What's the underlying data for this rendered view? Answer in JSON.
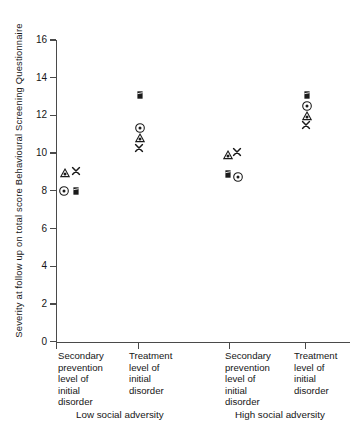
{
  "chart_data": {
    "type": "scatter",
    "title": "",
    "xlabel": "",
    "ylabel": "Severity at follow up on total score Behavioural Screening Questionnaire",
    "ylim": [
      0,
      16
    ],
    "yticks": [
      0,
      2,
      4,
      6,
      8,
      10,
      12,
      14,
      16
    ],
    "ytick_labels": [
      "0",
      "2",
      "4",
      "6",
      "8",
      "10",
      "12",
      "14",
      "16"
    ],
    "grid": false,
    "legend": "none",
    "categories": [
      "Secondary prevention level of initial disorder",
      "Treatment level of initial disorder",
      "Secondary prevention level of initial disorder",
      "Treatment level of initial disorder"
    ],
    "groups": [
      {
        "name": "Low social adversity",
        "categories": [
          0,
          1
        ]
      },
      {
        "name": "High social adversity",
        "categories": [
          2,
          3
        ]
      }
    ],
    "series": [
      {
        "name": "circle-dot",
        "marker": "circle-dot",
        "values": [
          7.5,
          11.35,
          8.65,
          12.45
        ]
      },
      {
        "name": "triangle",
        "marker": "triangle",
        "values": [
          8.5,
          10.8,
          9.85,
          11.95
        ]
      },
      {
        "name": "cross",
        "marker": "x",
        "values": [
          8.6,
          10.25,
          10.0,
          11.5
        ]
      },
      {
        "name": "square",
        "marker": "square",
        "values": [
          7.5,
          13.1,
          8.7,
          13.1
        ]
      }
    ],
    "points": [
      {
        "category": 0,
        "marker": "triangle",
        "value": 8.5,
        "x_px": 65,
        "y_px": 173
      },
      {
        "category": 0,
        "marker": "x",
        "value": 8.6,
        "x_px": 76,
        "y_px": 171
      },
      {
        "category": 0,
        "marker": "circle-dot",
        "value": 7.5,
        "x_px": 64,
        "y_px": 191
      },
      {
        "category": 0,
        "marker": "square",
        "value": 7.5,
        "x_px": 76,
        "y_px": 191
      },
      {
        "category": 1,
        "marker": "square",
        "value": 13.1,
        "x_px": 140,
        "y_px": 95
      },
      {
        "category": 1,
        "marker": "circle-dot",
        "value": 11.35,
        "x_px": 140,
        "y_px": 128
      },
      {
        "category": 1,
        "marker": "triangle",
        "value": 10.8,
        "x_px": 140,
        "y_px": 138
      },
      {
        "category": 1,
        "marker": "x",
        "value": 10.25,
        "x_px": 139,
        "y_px": 148
      },
      {
        "category": 2,
        "marker": "triangle",
        "value": 9.85,
        "x_px": 228,
        "y_px": 155
      },
      {
        "category": 2,
        "marker": "x",
        "value": 10.0,
        "x_px": 237,
        "y_px": 152
      },
      {
        "category": 2,
        "marker": "square",
        "value": 8.7,
        "x_px": 228,
        "y_px": 174
      },
      {
        "category": 2,
        "marker": "circle-dot",
        "value": 8.65,
        "x_px": 238,
        "y_px": 177
      },
      {
        "category": 3,
        "marker": "square",
        "value": 13.1,
        "x_px": 307,
        "y_px": 95
      },
      {
        "category": 3,
        "marker": "circle-dot",
        "value": 12.45,
        "x_px": 307,
        "y_px": 106
      },
      {
        "category": 3,
        "marker": "triangle",
        "value": 11.95,
        "x_px": 307,
        "y_px": 116
      },
      {
        "category": 3,
        "marker": "x",
        "value": 11.5,
        "x_px": 306,
        "y_px": 125
      }
    ],
    "x_tick_px": [
      56,
      138,
      229,
      305
    ],
    "colors": {
      "axis": "#4a4a4a",
      "marker": "#1a1a1a",
      "text": "#161616",
      "background": "#ffffff"
    }
  },
  "axis": {
    "y_title": "Severity at follow up on total score Behavioural Screening Questionnaire"
  },
  "x_categories": [
    {
      "label": "Secondary\nprevention\nlevel of\ninitial\ndisorder",
      "left_px": 58
    },
    {
      "label": "Treatment\nlevel of\ninitial\ndisorder",
      "left_px": 129
    },
    {
      "label": "Secondary\nprevention\nlevel of\ninitial\ndisorder",
      "left_px": 225
    },
    {
      "label": "Treatment\nlevel of\ninitial\ndisorder",
      "left_px": 294
    }
  ],
  "group_labels": [
    {
      "label": "Low social adversity",
      "left_px": 76,
      "top_px": 409
    },
    {
      "label": "High social adversity",
      "left_px": 235,
      "top_px": 409
    }
  ]
}
